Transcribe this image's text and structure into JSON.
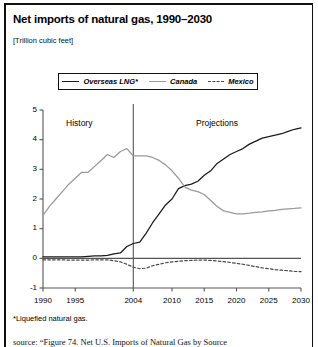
{
  "title": "Net imports of natural gas, 1990–2030",
  "units": "[Trillion cubic feet]",
  "footnote": "*Liquefied natural gas.",
  "source": "source: “Figure 74. Net U.S. Imports of Natural Gas by Source",
  "annotations": {
    "history": "History",
    "projections": "Projections"
  },
  "colors": {
    "overseas_lng": "#1a1a1a",
    "canada": "#9a9a9a",
    "mexico": "#4a4a4a",
    "axis": "#555555",
    "rule": "#111111"
  },
  "legend": [
    {
      "label": "Overseas LNG*",
      "style": "solid",
      "color": "#1a1a1a",
      "swatch": "sw-solid-dark"
    },
    {
      "label": "Canada",
      "style": "solid",
      "color": "#9a9a9a",
      "swatch": "sw-solid-light"
    },
    {
      "label": "Mexico",
      "style": "dashed",
      "color": "#4a4a4a",
      "swatch": "sw-dashed"
    }
  ],
  "chart_data": {
    "type": "line",
    "title": "Net imports of natural gas, 1990–2030",
    "xlabel": "",
    "ylabel": "Trillion cubic feet",
    "xlim": [
      1990,
      2030
    ],
    "ylim": [
      -1,
      5
    ],
    "yticks": [
      -1,
      0,
      1,
      2,
      3,
      4,
      5
    ],
    "xticks": [
      1990,
      1995,
      2004,
      2010,
      2015,
      2020,
      2025,
      2030
    ],
    "xtick_labels": [
      "1990",
      "1995",
      "2004",
      "2010",
      "2015",
      "2020",
      "2025",
      "2030"
    ],
    "ytick_labels": [
      "-1",
      "0",
      "1",
      "2",
      "3",
      "4",
      "5"
    ],
    "grid": false,
    "legend_position": "top",
    "history_projection_divider": 2004,
    "annotations": [
      {
        "text": "History",
        "x": 1996,
        "y": 4.55
      },
      {
        "text": "Projections",
        "x": 2018,
        "y": 4.55
      }
    ],
    "series": [
      {
        "name": "Overseas LNG*",
        "style": "solid",
        "color": "#1a1a1a",
        "x": [
          1990,
          1991,
          1992,
          1993,
          1994,
          1995,
          1996,
          1997,
          1998,
          1999,
          2000,
          2001,
          2002,
          2003,
          2004,
          2005,
          2006,
          2007,
          2008,
          2009,
          2010,
          2011,
          2012,
          2013,
          2014,
          2015,
          2016,
          2017,
          2018,
          2019,
          2020,
          2021,
          2022,
          2023,
          2024,
          2025,
          2026,
          2027,
          2028,
          2029,
          2030
        ],
        "values": [
          0.05,
          0.05,
          0.05,
          0.05,
          0.05,
          0.05,
          0.05,
          0.07,
          0.08,
          0.08,
          0.1,
          0.15,
          0.18,
          0.4,
          0.5,
          0.55,
          0.85,
          1.2,
          1.5,
          1.8,
          2.0,
          2.35,
          2.45,
          2.5,
          2.6,
          2.8,
          2.95,
          3.2,
          3.35,
          3.5,
          3.6,
          3.7,
          3.85,
          3.95,
          4.05,
          4.1,
          4.15,
          4.2,
          4.28,
          4.35,
          4.4
        ]
      },
      {
        "name": "Canada",
        "style": "solid",
        "color": "#9a9a9a",
        "x": [
          1990,
          1991,
          1992,
          1993,
          1994,
          1995,
          1996,
          1997,
          1998,
          1999,
          2000,
          2001,
          2002,
          2003,
          2004,
          2005,
          2006,
          2007,
          2008,
          2009,
          2010,
          2011,
          2012,
          2013,
          2014,
          2015,
          2016,
          2017,
          2018,
          2019,
          2020,
          2021,
          2022,
          2023,
          2024,
          2025,
          2026,
          2027,
          2028,
          2029,
          2030
        ],
        "values": [
          1.45,
          1.75,
          2.0,
          2.25,
          2.5,
          2.7,
          2.9,
          2.9,
          3.1,
          3.3,
          3.5,
          3.4,
          3.6,
          3.7,
          3.45,
          3.45,
          3.45,
          3.4,
          3.3,
          3.15,
          2.95,
          2.7,
          2.4,
          2.3,
          2.25,
          2.15,
          1.95,
          1.75,
          1.6,
          1.55,
          1.5,
          1.5,
          1.52,
          1.55,
          1.57,
          1.6,
          1.62,
          1.65,
          1.67,
          1.68,
          1.7
        ]
      },
      {
        "name": "Mexico",
        "style": "dashed",
        "color": "#4a4a4a",
        "x": [
          1990,
          1991,
          1992,
          1993,
          1994,
          1995,
          1996,
          1997,
          1998,
          1999,
          2000,
          2001,
          2002,
          2003,
          2004,
          2005,
          2006,
          2007,
          2008,
          2009,
          2010,
          2011,
          2012,
          2013,
          2014,
          2015,
          2016,
          2017,
          2018,
          2019,
          2020,
          2021,
          2022,
          2023,
          2024,
          2025,
          2026,
          2027,
          2028,
          2029,
          2030
        ],
        "values": [
          -0.05,
          -0.05,
          -0.05,
          -0.05,
          -0.06,
          -0.06,
          -0.06,
          -0.06,
          -0.05,
          -0.05,
          -0.05,
          -0.08,
          -0.12,
          -0.2,
          -0.3,
          -0.35,
          -0.33,
          -0.25,
          -0.2,
          -0.15,
          -0.12,
          -0.1,
          -0.08,
          -0.07,
          -0.06,
          -0.06,
          -0.07,
          -0.09,
          -0.11,
          -0.14,
          -0.17,
          -0.2,
          -0.24,
          -0.28,
          -0.32,
          -0.35,
          -0.38,
          -0.4,
          -0.42,
          -0.44,
          -0.45
        ]
      }
    ]
  }
}
